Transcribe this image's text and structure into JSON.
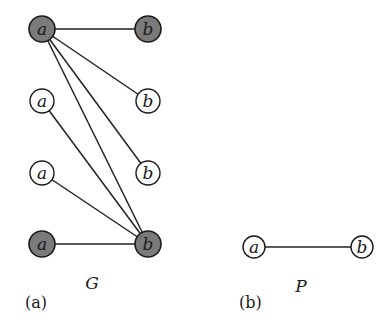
{
  "figure": {
    "panels": [
      {
        "id": "a",
        "panel_label": "(a)",
        "graph_label": "G",
        "nodes": [
          {
            "id": "a1",
            "label": "a",
            "shaded": true,
            "x": 42,
            "y": 29
          },
          {
            "id": "a2",
            "label": "a",
            "shaded": false,
            "x": 42,
            "y": 101
          },
          {
            "id": "a3",
            "label": "a",
            "shaded": false,
            "x": 42,
            "y": 173
          },
          {
            "id": "a4",
            "label": "a",
            "shaded": true,
            "x": 42,
            "y": 244
          },
          {
            "id": "b1",
            "label": "b",
            "shaded": true,
            "x": 148,
            "y": 29
          },
          {
            "id": "b2",
            "label": "b",
            "shaded": false,
            "x": 148,
            "y": 101
          },
          {
            "id": "b3",
            "label": "b",
            "shaded": false,
            "x": 148,
            "y": 173
          },
          {
            "id": "b4",
            "label": "b",
            "shaded": true,
            "x": 148,
            "y": 244
          }
        ],
        "edges": [
          [
            "a1",
            "b1"
          ],
          [
            "a1",
            "b2"
          ],
          [
            "a1",
            "b3"
          ],
          [
            "a1",
            "b4"
          ],
          [
            "a2",
            "b4"
          ],
          [
            "a3",
            "b4"
          ],
          [
            "a4",
            "b4"
          ]
        ]
      },
      {
        "id": "b",
        "panel_label": "(b)",
        "graph_label": "P",
        "nodes": [
          {
            "id": "pa",
            "label": "a",
            "shaded": false,
            "x": 254,
            "y": 247
          },
          {
            "id": "pb",
            "label": "b",
            "shaded": false,
            "x": 362,
            "y": 247
          }
        ],
        "edges": [
          [
            "pa",
            "pb"
          ]
        ]
      }
    ],
    "colors": {
      "shaded_fill": "#7a7a7a",
      "stroke": "#1a1a1a",
      "background": "#ffffff"
    }
  }
}
